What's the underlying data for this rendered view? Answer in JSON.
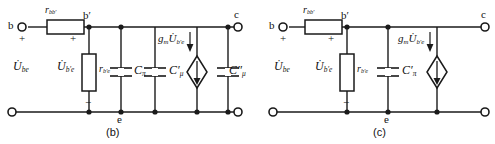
{
  "figure": {
    "type": "circuit-diagram",
    "panels": [
      {
        "id": "b",
        "caption": "(b)",
        "terminals": [
          {
            "name": "b",
            "label": "b",
            "position": "top-left"
          },
          {
            "name": "c",
            "label": "c",
            "position": "top-right"
          },
          {
            "name": "e-left",
            "label": "",
            "position": "bottom-left"
          },
          {
            "name": "e-right",
            "label": "",
            "position": "bottom-right"
          }
        ],
        "nodes": [
          {
            "name": "b-prime",
            "label": "b′"
          },
          {
            "name": "e",
            "label": "e"
          }
        ],
        "polarity": {
          "plus_input": "+",
          "plus_internal": "+",
          "minus_internal": "−",
          "minus_input": "−"
        },
        "components": [
          {
            "name": "r-bb-prime",
            "kind": "resistor",
            "orientation": "horizontal",
            "symbol": "r",
            "sub": "bb′",
            "label": "r_bb′"
          },
          {
            "name": "u-be",
            "kind": "voltage-label",
            "symbol": "U",
            "sub": "be",
            "dot": true,
            "label": "U̇_be"
          },
          {
            "name": "u-b-prime-e",
            "kind": "voltage-label",
            "symbol": "U",
            "sub": "b′e",
            "dot": true,
            "label": "U̇_b′e"
          },
          {
            "name": "r-b-prime-e",
            "kind": "resistor",
            "orientation": "vertical",
            "symbol": "r",
            "sub": "b′e",
            "label": "r_b′e"
          },
          {
            "name": "c-pi",
            "kind": "capacitor",
            "orientation": "vertical",
            "symbol": "C",
            "sub": "π",
            "prime": "",
            "label": "C_π"
          },
          {
            "name": "c-mu-prime",
            "kind": "capacitor",
            "orientation": "vertical",
            "symbol": "C",
            "sub": "μ",
            "prime": "′",
            "label": "C′_μ"
          },
          {
            "name": "c-mu-double-prime",
            "kind": "capacitor",
            "orientation": "vertical",
            "symbol": "C",
            "sub": "μ",
            "prime": "″",
            "label": "C″_μ"
          },
          {
            "name": "vccs",
            "kind": "current-source-diamond",
            "symbol": "g",
            "sub_g": "m",
            "v_symbol": "U",
            "v_sub": "b′e",
            "label": "g_m U̇_b′e"
          }
        ]
      },
      {
        "id": "c",
        "caption": "(c)",
        "terminals": [
          {
            "name": "b",
            "label": "b",
            "position": "top-left"
          },
          {
            "name": "c",
            "label": "c",
            "position": "top-right"
          },
          {
            "name": "e-left",
            "label": "",
            "position": "bottom-left"
          },
          {
            "name": "e-right",
            "label": "",
            "position": "bottom-right"
          }
        ],
        "nodes": [
          {
            "name": "b-prime",
            "label": "b′"
          },
          {
            "name": "e",
            "label": "e"
          }
        ],
        "polarity": {
          "plus_input": "+",
          "plus_internal": "+",
          "minus_internal": "−",
          "minus_input": "−"
        },
        "components": [
          {
            "name": "r-bb-prime",
            "kind": "resistor",
            "orientation": "horizontal",
            "symbol": "r",
            "sub": "bb′",
            "label": "r_bb′"
          },
          {
            "name": "u-be",
            "kind": "voltage-label",
            "symbol": "U",
            "sub": "be",
            "dot": true,
            "label": "U̇_be"
          },
          {
            "name": "u-b-prime-e",
            "kind": "voltage-label",
            "symbol": "U",
            "sub": "b′e",
            "dot": true,
            "label": "U̇_b′e"
          },
          {
            "name": "r-b-prime-e",
            "kind": "resistor",
            "orientation": "vertical",
            "symbol": "r",
            "sub": "b′e",
            "label": "r_b′e"
          },
          {
            "name": "c-pi-prime",
            "kind": "capacitor",
            "orientation": "vertical",
            "symbol": "C",
            "sub": "π",
            "prime": "′",
            "label": "C′_π"
          },
          {
            "name": "vccs",
            "kind": "current-source-diamond",
            "symbol": "g",
            "sub_g": "m",
            "v_symbol": "U",
            "v_sub": "b′e",
            "label": "g_m U̇_b′e"
          }
        ]
      }
    ],
    "colors": {
      "line": "#1a1a1a",
      "background": "#ffffff",
      "text": "#111111"
    }
  }
}
